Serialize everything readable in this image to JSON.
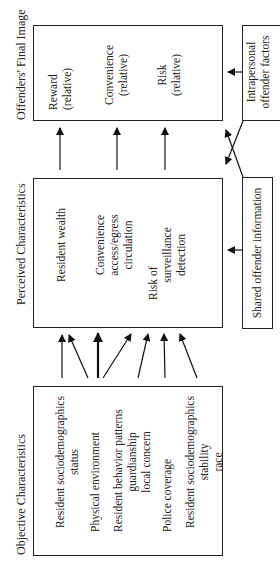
{
  "diagram": {
    "sections": {
      "objective": {
        "title": "Objective Characteristics",
        "items": [
          [
            "Resident sociodemographics",
            "status"
          ],
          [
            "Physical environment"
          ],
          [
            "Resident behavior patterns",
            "guardianship",
            "local concern"
          ],
          [
            "Police coverage"
          ],
          [
            "Resident sociodemographics",
            "stability",
            "race"
          ]
        ]
      },
      "perceived": {
        "title": "Perceived Characteristics",
        "items": [
          [
            "Resident wealth"
          ],
          [
            "Convenience",
            "access/egress",
            "circulation"
          ],
          [
            "Risk of",
            "surveillance",
            "detection"
          ]
        ]
      },
      "final": {
        "title": "Offenders' Final Image",
        "items": [
          [
            "Reward",
            "(relative)"
          ],
          [
            "Convenience",
            "(relative)"
          ],
          [
            "Risk",
            "(relative)"
          ]
        ]
      },
      "shared": {
        "title": "Shared offender information"
      },
      "intrapersonal": {
        "title": [
          "Intrapersonal",
          "offender factors"
        ]
      }
    }
  }
}
